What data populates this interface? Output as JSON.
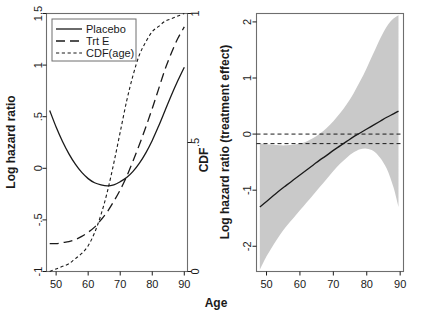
{
  "figure": {
    "shared_xlabel": "Age"
  },
  "chart_data": [
    {
      "type": "line",
      "panel": "left",
      "title": "",
      "xlabel": "Age",
      "ylabel": "Log hazard ratio",
      "y2label": "CDF",
      "xlim": [
        47,
        91
      ],
      "ylim": [
        -1,
        1.5
      ],
      "y2lim": [
        0,
        1
      ],
      "xticks": [
        50,
        60,
        70,
        80,
        90
      ],
      "xticklabels": [
        "50",
        "60",
        "70",
        "80",
        "90"
      ],
      "yticks": [
        -1,
        -0.5,
        0,
        0.5,
        1,
        1.5
      ],
      "yticklabels": [
        "-1",
        "-.5",
        "0",
        ".5",
        "1",
        "1.5"
      ],
      "y2ticks": [
        0,
        0.5,
        1
      ],
      "y2ticklabels": [
        "0",
        ".5",
        "1"
      ],
      "grid": false,
      "legend_position": "top-left",
      "legend": [
        "Placebo",
        "Trt E",
        "CDF(age)"
      ],
      "series": [
        {
          "name": "Placebo",
          "style": "solid",
          "x": [
            48,
            50,
            52,
            54,
            56,
            58,
            60,
            62,
            64,
            66,
            68,
            70,
            72,
            74,
            76,
            78,
            80,
            82,
            84,
            86,
            88,
            90
          ],
          "values": [
            0.56,
            0.4,
            0.26,
            0.14,
            0.04,
            -0.04,
            -0.1,
            -0.14,
            -0.16,
            -0.17,
            -0.16,
            -0.13,
            -0.09,
            -0.03,
            0.05,
            0.15,
            0.27,
            0.41,
            0.56,
            0.71,
            0.85,
            0.98
          ]
        },
        {
          "name": "Trt E",
          "style": "long-dash",
          "x": [
            48,
            50,
            52,
            54,
            56,
            58,
            60,
            62,
            64,
            66,
            68,
            70,
            72,
            74,
            76,
            78,
            80,
            82,
            84,
            86,
            88,
            90
          ],
          "values": [
            -0.73,
            -0.73,
            -0.72,
            -0.71,
            -0.69,
            -0.66,
            -0.62,
            -0.57,
            -0.5,
            -0.42,
            -0.32,
            -0.21,
            -0.08,
            0.07,
            0.23,
            0.4,
            0.58,
            0.77,
            0.96,
            1.12,
            1.26,
            1.37
          ]
        },
        {
          "name": "CDF(age)",
          "style": "short-dash",
          "axis": "right",
          "x": [
            48,
            50,
            52,
            54,
            56,
            58,
            60,
            62,
            64,
            66,
            68,
            70,
            72,
            74,
            76,
            78,
            80,
            82,
            84,
            86,
            88,
            90
          ],
          "values": [
            0.0,
            0.01,
            0.02,
            0.03,
            0.05,
            0.07,
            0.1,
            0.15,
            0.22,
            0.31,
            0.42,
            0.54,
            0.66,
            0.76,
            0.84,
            0.89,
            0.93,
            0.95,
            0.97,
            0.98,
            0.99,
            1.0
          ]
        }
      ]
    },
    {
      "type": "line",
      "panel": "right",
      "title": "",
      "xlabel": "Age",
      "ylabel": "Log hazard ratio (treatment effect)",
      "xlim": [
        47,
        91
      ],
      "ylim": [
        -2.45,
        2.15
      ],
      "xticks": [
        50,
        60,
        70,
        80,
        90
      ],
      "xticklabels": [
        "50",
        "60",
        "70",
        "80",
        "90"
      ],
      "yticks": [
        -2,
        -1,
        0,
        1,
        2
      ],
      "yticklabels": [
        "-2",
        "-1",
        "0",
        "1",
        "2"
      ],
      "grid": false,
      "legend_position": "none",
      "reference_lines": [
        {
          "name": "zero-line",
          "y": 0.0,
          "style": "dashed"
        },
        {
          "name": "effect-line",
          "y": -0.17,
          "style": "dashed"
        }
      ],
      "band": {
        "name": "confidence-band",
        "color": "#c9c9c9",
        "x": [
          48,
          50,
          52,
          54,
          56,
          58,
          60,
          62,
          64,
          66,
          68,
          70,
          72,
          74,
          76,
          78,
          80,
          82,
          84,
          86,
          88,
          89.5
        ],
        "lower": [
          -2.42,
          -2.18,
          -1.98,
          -1.8,
          -1.64,
          -1.5,
          -1.36,
          -1.22,
          -1.08,
          -0.94,
          -0.8,
          -0.66,
          -0.53,
          -0.42,
          -0.33,
          -0.27,
          -0.26,
          -0.3,
          -0.42,
          -0.62,
          -0.95,
          -1.3
        ],
        "upper": [
          -0.17,
          -0.18,
          -0.19,
          -0.2,
          -0.2,
          -0.19,
          -0.17,
          -0.13,
          -0.07,
          0.01,
          0.11,
          0.23,
          0.37,
          0.53,
          0.72,
          0.94,
          1.18,
          1.44,
          1.7,
          1.92,
          2.06,
          2.12
        ]
      },
      "series": [
        {
          "name": "treatment-effect",
          "style": "solid",
          "x": [
            48,
            50,
            52,
            54,
            56,
            58,
            60,
            62,
            64,
            66,
            68,
            70,
            72,
            74,
            76,
            78,
            80,
            82,
            84,
            86,
            88,
            89.5
          ],
          "values": [
            -1.3,
            -1.2,
            -1.1,
            -1.0,
            -0.91,
            -0.82,
            -0.73,
            -0.64,
            -0.55,
            -0.46,
            -0.38,
            -0.29,
            -0.21,
            -0.13,
            -0.05,
            0.02,
            0.09,
            0.16,
            0.23,
            0.3,
            0.36,
            0.41
          ]
        }
      ]
    }
  ]
}
